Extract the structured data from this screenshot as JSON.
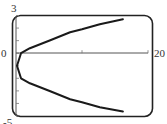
{
  "chart_data": {
    "type": "line",
    "title": "",
    "xlabel": "",
    "ylabel": "",
    "xlim": [
      0,
      20
    ],
    "ylim": [
      -5,
      3
    ],
    "grid": false,
    "legend": null,
    "x_tick_labels": [
      "0",
      "20"
    ],
    "y_tick_labels": [
      "3",
      "-5"
    ],
    "x_ticks": [
      0,
      10,
      20
    ],
    "y_ticks": [
      -5,
      -4,
      -3,
      -2,
      -1,
      0,
      1,
      2,
      3
    ],
    "series": [
      {
        "name": "curve",
        "color": "#1a1a1a",
        "points": [
          {
            "x": 16.2,
            "y": -4.65
          },
          {
            "x": 12.7,
            "y": -4.3
          },
          {
            "x": 10.0,
            "y": -3.9
          },
          {
            "x": 8.2,
            "y": -3.67
          },
          {
            "x": 5.2,
            "y": -3.03
          },
          {
            "x": 2.1,
            "y": -2.4
          },
          {
            "x": 0.76,
            "y": -2.0
          },
          {
            "x": 0.15,
            "y": -1.0
          },
          {
            "x": 0.76,
            "y": 0.0
          },
          {
            "x": 2.1,
            "y": 0.4
          },
          {
            "x": 5.2,
            "y": 1.03
          },
          {
            "x": 8.2,
            "y": 1.67
          },
          {
            "x": 10.0,
            "y": 1.9
          },
          {
            "x": 12.7,
            "y": 2.3
          },
          {
            "x": 16.2,
            "y": 2.7
          }
        ]
      }
    ]
  },
  "labels": {
    "y_max": "3",
    "y_min": "-5",
    "x_origin": "0",
    "x_max": "20"
  },
  "colors": {
    "frame": "#222222",
    "curve": "#1a1a1a",
    "axis": "#555555"
  }
}
